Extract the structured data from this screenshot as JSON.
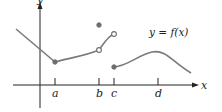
{
  "diagram": {
    "function_label": "y = f(x)",
    "axes": {
      "x_label": "x",
      "y_label": "y"
    },
    "ticks": [
      {
        "name": "a",
        "label": "a"
      },
      {
        "name": "b",
        "label": "b"
      },
      {
        "name": "c",
        "label": "c"
      },
      {
        "name": "d",
        "label": "d"
      }
    ],
    "points": [
      {
        "name": "min-at-a",
        "type": "filled"
      },
      {
        "name": "isolated-at-b",
        "type": "filled"
      },
      {
        "name": "hole-at-b",
        "type": "open"
      },
      {
        "name": "hole-before-c",
        "type": "open"
      },
      {
        "name": "start-at-c",
        "type": "filled"
      }
    ],
    "colors": {
      "axis": "#222222",
      "curve": "#7a7a7a",
      "dot": "#6e6e6e"
    }
  }
}
